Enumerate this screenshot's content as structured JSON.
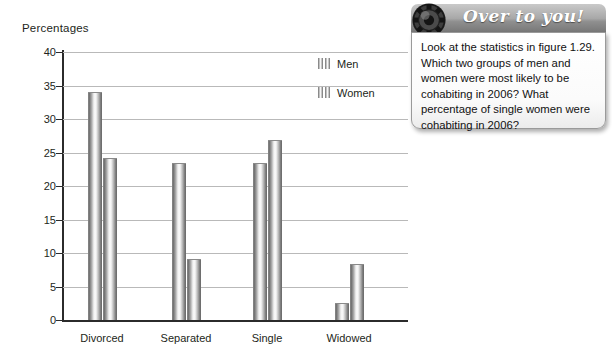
{
  "chart_data": {
    "type": "bar",
    "title": "",
    "ylabel": "Percentages",
    "xlabel": "",
    "ylim": [
      0,
      40
    ],
    "ytick_step": 5,
    "yticks": [
      "40",
      "35",
      "30",
      "25",
      "20",
      "15",
      "10",
      "5",
      "0"
    ],
    "grid": true,
    "legend_position": "top-right",
    "categories": [
      "Divorced",
      "Separated",
      "Single",
      "Widowed"
    ],
    "series": [
      {
        "name": "Men",
        "values": [
          34.0,
          23.5,
          23.4,
          2.5
        ]
      },
      {
        "name": "Women",
        "values": [
          24.2,
          9.1,
          26.8,
          8.3
        ]
      }
    ]
  },
  "chart": {
    "axis_title": "Percentages",
    "legend": [
      {
        "label": "Men"
      },
      {
        "label": "Women"
      }
    ]
  },
  "callout": {
    "icon": "gear-icon",
    "title": "Over to you!",
    "text": "Look at the statistics in figure 1.29. Which two groups of men and women were most likely to be cohabiting in 2006? What percentage of single women were cohabiting in 2006?"
  }
}
